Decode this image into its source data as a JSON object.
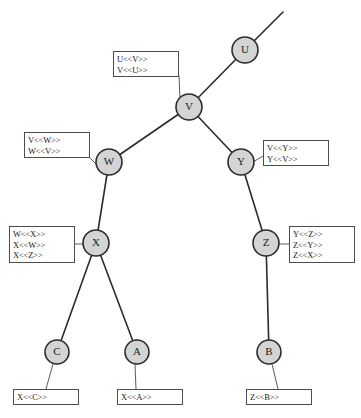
{
  "diagram": {
    "node_fill": "#d4d4d4",
    "node_stroke": "#2b2b2b",
    "edge_color": "#2b2b2b",
    "box_border": "#4d4d4d",
    "box_fill": "#ffffff",
    "text_color": "#1a1a1a",
    "nodes": [
      {
        "id": "U",
        "label": "U",
        "cx": 245,
        "cy": 50,
        "r": 13
      },
      {
        "id": "V",
        "label": "V",
        "cx": 189,
        "cy": 107,
        "r": 13
      },
      {
        "id": "W",
        "label": "W",
        "cx": 109,
        "cy": 162,
        "r": 13
      },
      {
        "id": "Y",
        "label": "Y",
        "cx": 241,
        "cy": 162,
        "r": 13
      },
      {
        "id": "X",
        "label": "X",
        "cx": 96,
        "cy": 243,
        "r": 13
      },
      {
        "id": "Z",
        "label": "Z",
        "cx": 266,
        "cy": 243,
        "r": 13
      },
      {
        "id": "C",
        "label": "C",
        "cx": 57,
        "cy": 352,
        "r": 12
      },
      {
        "id": "A",
        "label": "A",
        "cx": 137,
        "cy": 352,
        "r": 12
      },
      {
        "id": "B",
        "label": "B",
        "cx": 269,
        "cy": 352,
        "r": 12
      }
    ],
    "edges": [
      {
        "from": "U",
        "to": "V"
      },
      {
        "from": "V",
        "to": "W"
      },
      {
        "from": "V",
        "to": "Y"
      },
      {
        "from": "W",
        "to": "X"
      },
      {
        "from": "Y",
        "to": "Z"
      },
      {
        "from": "X",
        "to": "C"
      },
      {
        "from": "X",
        "to": "A"
      },
      {
        "from": "Z",
        "to": "B"
      }
    ],
    "open_edges": [
      {
        "from": "U",
        "x2": 283,
        "y2": 12
      }
    ],
    "annotations": [
      {
        "id": "uv",
        "lines": [
          "U<<V>>",
          "V<<U>>"
        ],
        "box": {
          "left": 113,
          "top": 51,
          "width": 66,
          "height": 26
        },
        "leader": {
          "x1": 179,
          "y1": 76,
          "x2": 180,
          "y2": 99
        }
      },
      {
        "id": "vw",
        "lines": [
          "V<<W>>",
          "W<<V>>"
        ],
        "box": {
          "left": 24,
          "top": 132,
          "width": 66,
          "height": 26
        },
        "leader": {
          "x1": 90,
          "y1": 158,
          "x2": 98,
          "y2": 166
        }
      },
      {
        "id": "vy",
        "lines": [
          "V<<Y>>",
          "Y<<V>>"
        ],
        "box": {
          "left": 263,
          "top": 140,
          "width": 66,
          "height": 26
        },
        "leader": {
          "x1": 263,
          "y1": 156,
          "x2": 253,
          "y2": 162
        }
      },
      {
        "id": "wxz",
        "lines": [
          "W<<X>>",
          "X<<W>>",
          "X<<Z>>"
        ],
        "box": {
          "left": 9,
          "top": 226,
          "width": 66,
          "height": 37
        },
        "leader": {
          "x1": 75,
          "y1": 244,
          "x2": 83,
          "y2": 244
        }
      },
      {
        "id": "yzx",
        "lines": [
          "Y<<Z>>",
          "Z<<Y>>",
          "Z<<X>>"
        ],
        "box": {
          "left": 289,
          "top": 226,
          "width": 66,
          "height": 37
        },
        "leader": {
          "x1": 289,
          "y1": 244,
          "x2": 279,
          "y2": 244
        }
      },
      {
        "id": "xc",
        "lines": [
          "X<<C>>"
        ],
        "box": {
          "left": 13,
          "top": 389,
          "width": 66,
          "height": 16
        },
        "leader": {
          "x1": 46,
          "y1": 389,
          "x2": 53,
          "y2": 364
        }
      },
      {
        "id": "xa",
        "lines": [
          "X<<A>>"
        ],
        "box": {
          "left": 117,
          "top": 389,
          "width": 66,
          "height": 16
        },
        "leader": {
          "x1": 136,
          "y1": 389,
          "x2": 135,
          "y2": 364
        }
      },
      {
        "id": "zb",
        "lines": [
          "Z<<B>>"
        ],
        "box": {
          "left": 246,
          "top": 389,
          "width": 66,
          "height": 16
        },
        "leader": {
          "x1": 278,
          "y1": 389,
          "x2": 272,
          "y2": 364
        }
      }
    ]
  }
}
